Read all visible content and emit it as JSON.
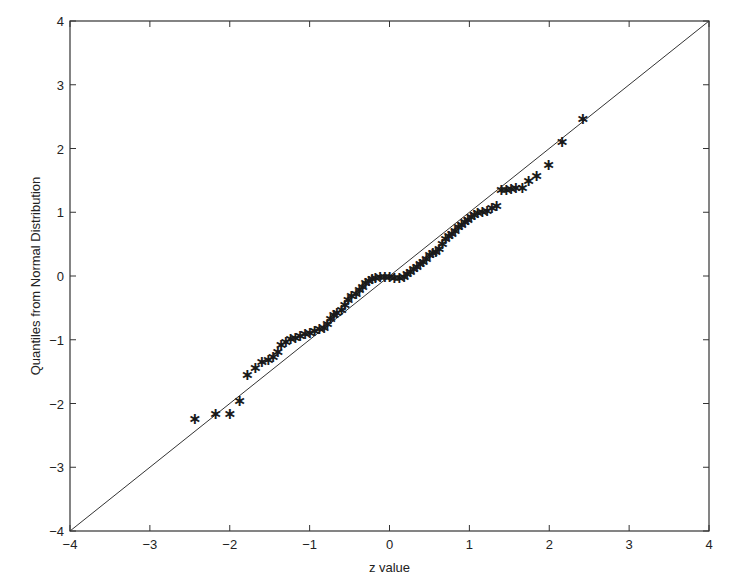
{
  "chart_data": {
    "type": "scatter",
    "title": "",
    "xlabel": "z value",
    "ylabel": "Quantiles from Normal Distribution",
    "xlim": [
      -4,
      4
    ],
    "ylim": [
      -4,
      4
    ],
    "xticks": [
      -4,
      -3,
      -2,
      -1,
      0,
      1,
      2,
      3,
      4
    ],
    "yticks": [
      -4,
      -3,
      -2,
      -1,
      0,
      1,
      2,
      3,
      4
    ],
    "grid": false,
    "legend": null,
    "marker": "*",
    "reference_line": {
      "x": [
        -4,
        4
      ],
      "y": [
        -4,
        4
      ],
      "label": "y = x"
    },
    "series": [
      {
        "name": "sample quantiles",
        "points": [
          [
            -2.44,
            -2.23
          ],
          [
            -2.18,
            -2.15
          ],
          [
            -2.0,
            -2.15
          ],
          [
            -1.88,
            -1.94
          ],
          [
            -1.78,
            -1.54
          ],
          [
            -1.68,
            -1.42
          ],
          [
            -1.6,
            -1.33
          ],
          [
            -1.52,
            -1.3
          ],
          [
            -1.46,
            -1.25
          ],
          [
            -1.4,
            -1.18
          ],
          [
            -1.36,
            -1.06
          ],
          [
            -1.3,
            -1.02
          ],
          [
            -1.24,
            -0.98
          ],
          [
            -1.18,
            -0.96
          ],
          [
            -1.12,
            -0.93
          ],
          [
            -1.06,
            -0.9
          ],
          [
            -1.0,
            -0.88
          ],
          [
            -0.94,
            -0.85
          ],
          [
            -0.88,
            -0.82
          ],
          [
            -0.82,
            -0.8
          ],
          [
            -0.78,
            -0.74
          ],
          [
            -0.74,
            -0.66
          ],
          [
            -0.7,
            -0.6
          ],
          [
            -0.66,
            -0.56
          ],
          [
            -0.6,
            -0.52
          ],
          [
            -0.56,
            -0.44
          ],
          [
            -0.52,
            -0.36
          ],
          [
            -0.48,
            -0.3
          ],
          [
            -0.42,
            -0.26
          ],
          [
            -0.38,
            -0.2
          ],
          [
            -0.34,
            -0.15
          ],
          [
            -0.3,
            -0.1
          ],
          [
            -0.26,
            -0.06
          ],
          [
            -0.22,
            -0.03
          ],
          [
            -0.18,
            -0.01
          ],
          [
            -0.12,
            0.0
          ],
          [
            -0.06,
            0.0
          ],
          [
            0.0,
            0.0
          ],
          [
            0.06,
            -0.01
          ],
          [
            0.12,
            -0.02
          ],
          [
            0.18,
            0.0
          ],
          [
            0.22,
            0.04
          ],
          [
            0.26,
            0.08
          ],
          [
            0.3,
            0.12
          ],
          [
            0.34,
            0.16
          ],
          [
            0.38,
            0.2
          ],
          [
            0.42,
            0.24
          ],
          [
            0.46,
            0.28
          ],
          [
            0.5,
            0.34
          ],
          [
            0.54,
            0.38
          ],
          [
            0.58,
            0.4
          ],
          [
            0.62,
            0.44
          ],
          [
            0.66,
            0.52
          ],
          [
            0.7,
            0.6
          ],
          [
            0.74,
            0.64
          ],
          [
            0.78,
            0.68
          ],
          [
            0.82,
            0.72
          ],
          [
            0.86,
            0.78
          ],
          [
            0.9,
            0.82
          ],
          [
            0.94,
            0.86
          ],
          [
            0.98,
            0.9
          ],
          [
            1.02,
            0.94
          ],
          [
            1.06,
            0.98
          ],
          [
            1.1,
            1.0
          ],
          [
            1.16,
            1.02
          ],
          [
            1.22,
            1.04
          ],
          [
            1.28,
            1.08
          ],
          [
            1.34,
            1.12
          ],
          [
            1.4,
            1.36
          ],
          [
            1.46,
            1.37
          ],
          [
            1.52,
            1.38
          ],
          [
            1.58,
            1.39
          ],
          [
            1.66,
            1.4
          ],
          [
            1.74,
            1.5
          ],
          [
            1.84,
            1.58
          ],
          [
            1.99,
            1.76
          ],
          [
            2.16,
            2.12
          ],
          [
            2.42,
            2.48
          ]
        ]
      }
    ]
  }
}
